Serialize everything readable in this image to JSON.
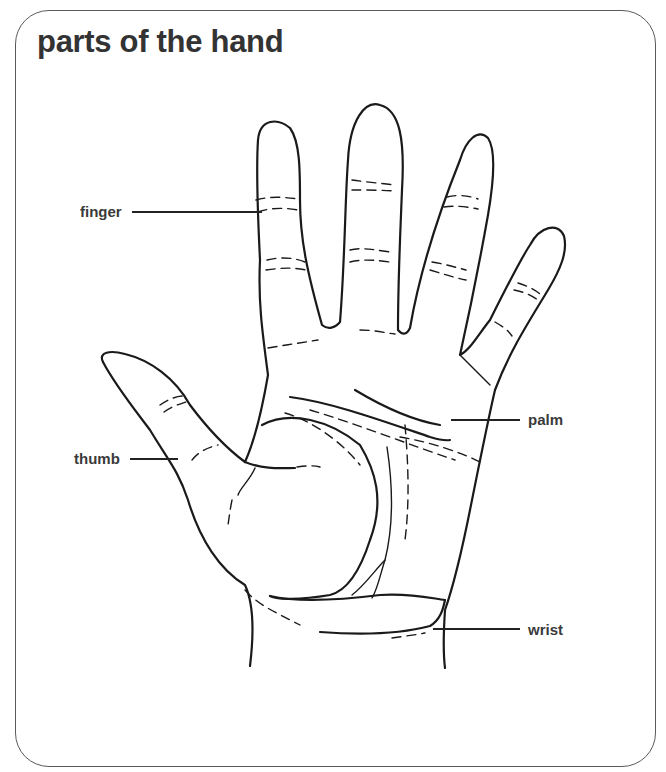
{
  "title": "parts of the hand",
  "labels": {
    "finger": "finger",
    "thumb": "thumb",
    "palm": "palm",
    "wrist": "wrist"
  },
  "colors": {
    "text": "#333333",
    "line": "#1a1a1a",
    "frame": "#5a5a5a",
    "background": "#ffffff"
  }
}
